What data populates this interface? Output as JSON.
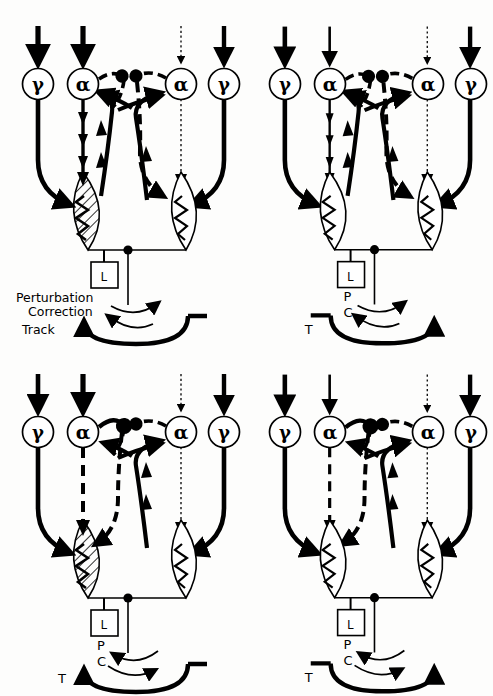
{
  "figure": {
    "type": "neurophysiology-circuit-diagram",
    "background_color": "#fdfdfc",
    "ink_color": "#000000",
    "width": 493,
    "height": 696,
    "panel_count": 4,
    "grid": "2x2"
  },
  "legend_labels": {
    "perturbation_full": "Perturbation",
    "correction_full": "Correction",
    "track_full": "Track",
    "perturbation_abbr": "P",
    "correction_abbr": "C",
    "track_abbr": "T",
    "load_abbr": "L"
  },
  "neuron_labels": {
    "gamma": "γ",
    "alpha": "α"
  },
  "panels": [
    {
      "id": "panel-top-left",
      "position": "top-left",
      "x": 0,
      "y": 0,
      "labels_style": "full",
      "labels": [
        "Perturbation",
        "Correction",
        "Track"
      ],
      "load_box": "L",
      "neurons": [
        {
          "name": "gamma-left",
          "symbol": "γ",
          "cx": 38,
          "cy": 84
        },
        {
          "name": "alpha-left",
          "symbol": "α",
          "cx": 83,
          "cy": 84
        },
        {
          "name": "alpha-right",
          "symbol": "α",
          "cx": 181,
          "cy": 84
        },
        {
          "name": "gamma-right",
          "symbol": "γ",
          "cx": 224,
          "cy": 84
        }
      ],
      "muscles": [
        {
          "name": "muscle-left",
          "state": "contracting",
          "fill": "hatched"
        },
        {
          "name": "muscle-right",
          "state": "relaxed",
          "fill": "white"
        }
      ],
      "input_arrows": [
        {
          "name": "input-gamma-left",
          "style": "thick-solid"
        },
        {
          "name": "input-alpha-left",
          "style": "thick-solid"
        },
        {
          "name": "input-alpha-right",
          "style": "dotted-faint"
        },
        {
          "name": "input-gamma-right",
          "style": "thick-solid"
        }
      ],
      "efferents": [
        {
          "name": "alpha-left-efferent",
          "style": "solid-active"
        },
        {
          "name": "alpha-right-efferent",
          "style": "dotted-silent"
        }
      ],
      "arcs": {
        "perturbation": {
          "direction": "right"
        },
        "correction": {
          "direction": "left"
        },
        "track": {
          "direction": "left"
        }
      }
    },
    {
      "id": "panel-top-right",
      "position": "top-right",
      "x": 247,
      "y": 0,
      "labels_style": "abbr",
      "labels": [
        "L",
        "P",
        "C",
        "T"
      ],
      "load_box": "L",
      "neurons": [
        {
          "name": "gamma-left",
          "symbol": "γ",
          "cx": 38,
          "cy": 84
        },
        {
          "name": "alpha-left",
          "symbol": "α",
          "cx": 83,
          "cy": 84
        },
        {
          "name": "alpha-right",
          "symbol": "α",
          "cx": 181,
          "cy": 84
        },
        {
          "name": "gamma-right",
          "symbol": "γ",
          "cx": 224,
          "cy": 84
        }
      ],
      "muscles": [
        {
          "name": "muscle-left",
          "state": "relaxed",
          "fill": "white"
        },
        {
          "name": "muscle-right",
          "state": "relaxed",
          "fill": "white"
        }
      ],
      "input_arrows": [
        {
          "name": "input-gamma-left",
          "style": "thick-solid"
        },
        {
          "name": "input-alpha-left",
          "style": "thin-solid"
        },
        {
          "name": "input-alpha-right",
          "style": "dotted-faint"
        },
        {
          "name": "input-gamma-right",
          "style": "thick-solid"
        }
      ],
      "efferents": [
        {
          "name": "alpha-left-efferent",
          "style": "solid-active"
        },
        {
          "name": "alpha-right-efferent",
          "style": "dotted-silent"
        }
      ],
      "arcs": {
        "perturbation": {
          "direction": "right"
        },
        "correction": {
          "direction": "left"
        },
        "track": {
          "direction": "right"
        }
      }
    },
    {
      "id": "panel-bottom-left",
      "position": "bottom-left",
      "x": 0,
      "y": 348,
      "labels_style": "abbr",
      "labels": [
        "L",
        "P",
        "C",
        "T"
      ],
      "load_box": "L",
      "neurons": [
        {
          "name": "gamma-left",
          "symbol": "γ",
          "cx": 38,
          "cy": 84
        },
        {
          "name": "alpha-left",
          "symbol": "α",
          "cx": 83,
          "cy": 84
        },
        {
          "name": "alpha-right",
          "symbol": "α",
          "cx": 181,
          "cy": 84
        },
        {
          "name": "gamma-right",
          "symbol": "γ",
          "cx": 224,
          "cy": 84
        }
      ],
      "muscles": [
        {
          "name": "muscle-left",
          "state": "contracting",
          "fill": "hatched"
        },
        {
          "name": "muscle-right",
          "state": "relaxed",
          "fill": "white"
        }
      ],
      "input_arrows": [
        {
          "name": "input-gamma-left",
          "style": "thick-solid"
        },
        {
          "name": "input-alpha-left",
          "style": "thick-solid"
        },
        {
          "name": "input-alpha-right",
          "style": "dotted-faint"
        },
        {
          "name": "input-gamma-right",
          "style": "thick-solid"
        }
      ],
      "efferents": [
        {
          "name": "alpha-left-efferent",
          "style": "dashed-inhibited"
        },
        {
          "name": "alpha-right-efferent",
          "style": "dotted-silent"
        }
      ],
      "arcs": {
        "perturbation": {
          "direction": "left"
        },
        "correction": {
          "direction": "right"
        },
        "track": {
          "direction": "left"
        }
      }
    },
    {
      "id": "panel-bottom-right",
      "position": "bottom-right",
      "x": 247,
      "y": 348,
      "labels_style": "abbr",
      "labels": [
        "L",
        "P",
        "C",
        "T"
      ],
      "load_box": "L",
      "neurons": [
        {
          "name": "gamma-left",
          "symbol": "γ",
          "cx": 38,
          "cy": 84
        },
        {
          "name": "alpha-left",
          "symbol": "α",
          "cx": 83,
          "cy": 84
        },
        {
          "name": "alpha-right",
          "symbol": "α",
          "cx": 181,
          "cy": 84
        },
        {
          "name": "gamma-right",
          "symbol": "γ",
          "cx": 224,
          "cy": 84
        }
      ],
      "muscles": [
        {
          "name": "muscle-left",
          "state": "relaxed",
          "fill": "white"
        },
        {
          "name": "muscle-right",
          "state": "relaxed",
          "fill": "white"
        }
      ],
      "input_arrows": [
        {
          "name": "input-gamma-left",
          "style": "thick-solid"
        },
        {
          "name": "input-alpha-left",
          "style": "thin-solid"
        },
        {
          "name": "input-alpha-right",
          "style": "dotted-faint"
        },
        {
          "name": "input-gamma-right",
          "style": "thick-solid"
        }
      ],
      "efferents": [
        {
          "name": "alpha-left-efferent",
          "style": "dashed-inhibited"
        },
        {
          "name": "alpha-right-efferent",
          "style": "dotted-silent"
        }
      ],
      "arcs": {
        "perturbation": {
          "direction": "left"
        },
        "correction": {
          "direction": "right"
        },
        "track": {
          "direction": "right"
        }
      }
    }
  ]
}
